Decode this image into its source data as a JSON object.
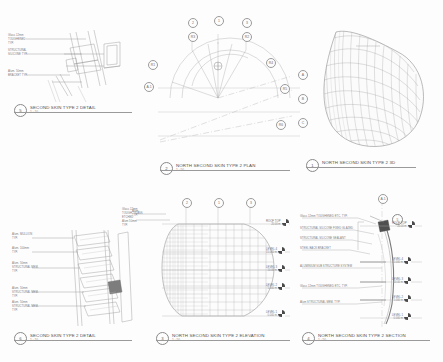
{
  "sheet": {
    "background": "#fdfdfd",
    "line_color": "#8a8a8a"
  },
  "views": [
    {
      "id": "second-skin-type-2-detail-top",
      "bubble": "5",
      "title": "SECOND SKIN TYPE 2 DETAIL",
      "scale": "1 : 10",
      "annotations": [
        "Glass 12mm TOUGHENED\nTYP.",
        "STRUCTURAL SILICONE\nTYP.",
        "Alum. 50mm\nBRACKET\nTYP."
      ]
    },
    {
      "id": "north-second-skin-type-2-plan",
      "bubble": "2",
      "title": "NORTH SECOND SKIN TYPE 2 PLAN",
      "scale": "1 : 50",
      "grid_bubbles_top": [
        "2",
        "1",
        "3"
      ],
      "radial_bubbles": [
        "R3",
        "R2",
        "R1",
        "R4",
        "R5",
        "R6",
        "R7",
        "R8"
      ],
      "center_tag": "C",
      "axis_bubbles_right": [
        "A",
        "B",
        "C"
      ],
      "axis_bubble_left": "A.1"
    },
    {
      "id": "north-second-skin-type-2-3d",
      "bubble": "1",
      "title": "NORTH SECOND SKIN TYPE 2 3D",
      "scale": "",
      "axis_bubbles": [
        "A",
        "B",
        "C"
      ]
    },
    {
      "id": "second-skin-type-2-detail-bottom",
      "bubble": "6",
      "title": "SECOND SKIN TYPE 2 DETAIL",
      "scale": "1 : 10",
      "annotations": [
        "Alum. MULLION\nTYP.",
        "Alum. 100mm\nTYP.",
        "Alum. 50mm\nSTRUCTURAL MEM.\nTYP.",
        "Alum. 50mm\nSTRUCTURAL MEM.\nTYP.",
        "Alum. 50mm\nSTRUCTURAL MEM.\nTYP."
      ],
      "corner_note": "Glass 12mm\nTOUGH. GLASS\nETCHED\nAlum 50mm\nTYP."
    },
    {
      "id": "north-second-skin-type-2-elevation",
      "bubble": "3",
      "title": "NORTH SECOND SKIN TYPE 2 ELEVATION",
      "scale": "1 : 50",
      "grid_bubbles_top": [
        "2",
        "1",
        "3"
      ],
      "levels": [
        {
          "name": "ROOF TOP",
          "elev": "20.00 m"
        },
        {
          "name": "LEVEL 4",
          "elev": "15.000 m"
        },
        {
          "name": "LEVEL 3",
          "elev": "10.00 m"
        },
        {
          "name": "LEVEL 2",
          "elev": "5.000 m"
        },
        {
          "name": "LEVEL 1",
          "elev": "0.000 m"
        }
      ],
      "side_note": "Alum.\nTYP."
    },
    {
      "id": "north-second-skin-type-2-section",
      "bubble": "4",
      "title": "NORTH SECOND SKIN TYPE 2 SECTION",
      "scale": "1 : 50",
      "section_key": "5",
      "top_bubble": "A.1",
      "annotations": [
        "Glass 12mm TOUGHENED ETC. TYP.",
        "STRUCTURAL SILICONE FIXED GLAZED",
        "STRUCTURAL SILICONE SEALANT",
        "STEEL BACK BRACKET",
        "ALUMINIUM SUB STRUCTURE SYSTEM",
        "Glass 12mm TOUGHENED ETC. TYP.",
        "Alum STRUCTURAL MEM. TYP."
      ],
      "levels": [
        {
          "name": "ROOF TOP",
          "elev": "20.00 m"
        },
        {
          "name": "LEVEL 4",
          "elev": "15.000 m"
        },
        {
          "name": "LEVEL 3",
          "elev": "10.00 m"
        },
        {
          "name": "LEVEL 2",
          "elev": "5.000 m"
        },
        {
          "name": "LEVEL 1",
          "elev": "0.000 m"
        }
      ]
    }
  ]
}
